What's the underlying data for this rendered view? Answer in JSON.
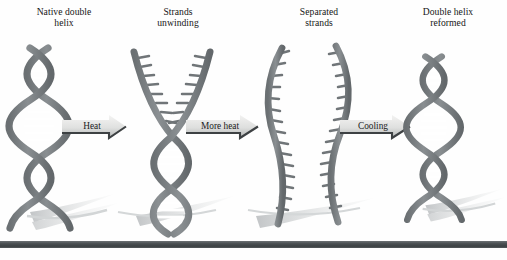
{
  "figure": {
    "background_color": "#fefefe",
    "rule_color": "#454a4d"
  },
  "panels": [
    {
      "id": "native-double-helix",
      "caption": "Native double\nhelix",
      "state": "double helix",
      "description": "Intact B-form double helix with paired bases shown as horizontal rungs"
    },
    {
      "id": "strands-unwinding",
      "caption": "Strands\nunwinding",
      "state": "partially denatured",
      "description": "Helix opening from the top into a Y-shaped fork; unpaired bases appear as comb-like ticks while the lower region remains wound"
    },
    {
      "id": "separated-strands",
      "caption": "Separated\nstrands",
      "state": "fully denatured",
      "description": "Two free single strands, each with unpaired bases projecting as ticks"
    },
    {
      "id": "double-helix-reformed",
      "caption": "Double helix\nreformed",
      "state": "renatured",
      "description": "Complementary strands re-annealed into the original double helix"
    }
  ],
  "arrows": [
    {
      "id": "arrow-heat",
      "label": "Heat"
    },
    {
      "id": "arrow-more-heat",
      "label": "More heat"
    },
    {
      "id": "arrow-cooling",
      "label": "Cooling"
    }
  ],
  "colors": {
    "strand": "#7d8285",
    "strand_dark": "#5f6568",
    "rung": "#ffffff",
    "shadow": "#c9cccd",
    "arrow_body_light": "#f0f0ef",
    "arrow_body_dark": "#b9bbba",
    "arrow_edge": "#3d4143",
    "text": "#161616"
  }
}
